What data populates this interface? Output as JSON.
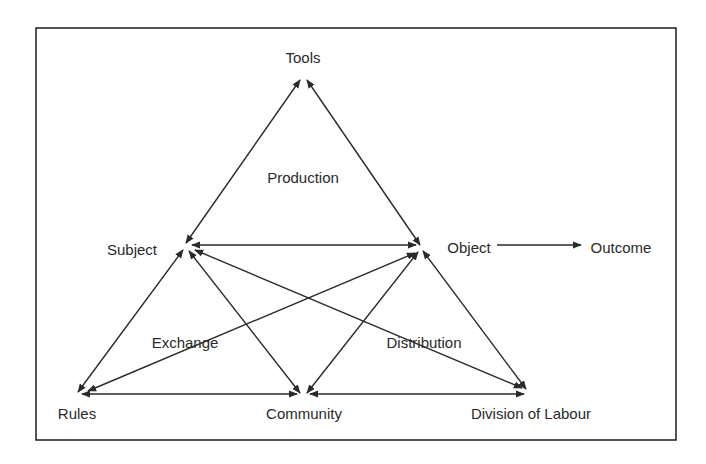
{
  "diagram": {
    "frame": {
      "x": 36,
      "y": 28,
      "width": 640,
      "height": 412
    },
    "nodes": [
      {
        "id": "tools",
        "label": "Tools",
        "x": 303,
        "y": 80,
        "label_x": 303,
        "label_y": 63,
        "anchor": "middle"
      },
      {
        "id": "subject",
        "label": "Subject",
        "x": 186,
        "y": 244,
        "label_x": 132,
        "label_y": 255,
        "anchor": "middle"
      },
      {
        "id": "object",
        "label": "Object",
        "x": 421,
        "y": 246,
        "label_x": 469,
        "label_y": 253,
        "anchor": "middle"
      },
      {
        "id": "outcome",
        "label": "Outcome",
        "x": 586,
        "y": 246,
        "label_x": 621,
        "label_y": 253,
        "anchor": "middle"
      },
      {
        "id": "rules",
        "label": "Rules",
        "x": 78,
        "y": 393,
        "label_x": 77,
        "label_y": 419,
        "anchor": "middle"
      },
      {
        "id": "community",
        "label": "Community",
        "x": 303,
        "y": 394,
        "label_x": 304,
        "label_y": 419,
        "anchor": "middle"
      },
      {
        "id": "division",
        "label": "Division of Labour",
        "x": 525,
        "y": 391,
        "label_x": 531,
        "label_y": 419,
        "anchor": "middle"
      }
    ],
    "regions": [
      {
        "id": "production",
        "label": "Production",
        "x": 303,
        "y": 183
      },
      {
        "id": "exchange",
        "label": "Exchange",
        "x": 185,
        "y": 348
      },
      {
        "id": "distribution",
        "label": "Distribution",
        "x": 424,
        "y": 348
      }
    ],
    "edges": [
      {
        "from": "subject",
        "to": "tools",
        "bidirectional": true,
        "x1": 186,
        "y1": 243,
        "x2": 300,
        "y2": 80
      },
      {
        "from": "tools",
        "to": "object",
        "bidirectional": true,
        "x1": 307,
        "y1": 80,
        "x2": 420,
        "y2": 245
      },
      {
        "from": "subject",
        "to": "object",
        "bidirectional": true,
        "x1": 192,
        "y1": 245,
        "x2": 416,
        "y2": 245
      },
      {
        "from": "subject",
        "to": "rules",
        "bidirectional": true,
        "x1": 183,
        "y1": 250,
        "x2": 78,
        "y2": 392
      },
      {
        "from": "subject",
        "to": "community",
        "bidirectional": true,
        "x1": 189,
        "y1": 251,
        "x2": 300,
        "y2": 393
      },
      {
        "from": "subject",
        "to": "division",
        "bidirectional": true,
        "x1": 195,
        "y1": 250,
        "x2": 522,
        "y2": 388
      },
      {
        "from": "object",
        "to": "rules",
        "bidirectional": true,
        "x1": 415,
        "y1": 253,
        "x2": 88,
        "y2": 391
      },
      {
        "from": "object",
        "to": "community",
        "bidirectional": true,
        "x1": 418,
        "y1": 252,
        "x2": 307,
        "y2": 393
      },
      {
        "from": "object",
        "to": "division",
        "bidirectional": true,
        "x1": 423,
        "y1": 251,
        "x2": 526,
        "y2": 389
      },
      {
        "from": "rules",
        "to": "community",
        "bidirectional": true,
        "x1": 82,
        "y1": 394,
        "x2": 297,
        "y2": 394
      },
      {
        "from": "community",
        "to": "division",
        "bidirectional": true,
        "x1": 310,
        "y1": 394,
        "x2": 524,
        "y2": 394
      },
      {
        "from": "object",
        "to": "outcome",
        "bidirectional": false,
        "x1": 497,
        "y1": 245,
        "x2": 581,
        "y2": 245
      }
    ]
  }
}
